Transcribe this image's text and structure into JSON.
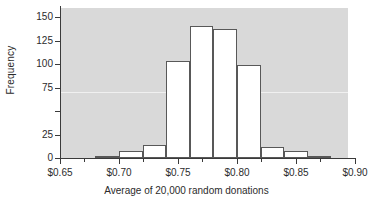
{
  "chart_data": {
    "type": "bar",
    "title": "",
    "subtitle": "",
    "xlabel": "Average of 20,000 random donations",
    "ylabel": "Frequency",
    "xlim": [
      0.65,
      0.9
    ],
    "ylim": [
      0,
      160
    ],
    "grid": true,
    "gridlines_y": [
      75
    ],
    "legend": null,
    "legend_position": "none",
    "bin_width": 0.02,
    "categories": [
      "0.68-0.70",
      "0.70-0.72",
      "0.72-0.74",
      "0.74-0.76",
      "0.76-0.78",
      "0.78-0.80",
      "0.80-0.82",
      "0.82-0.84",
      "0.84-0.86",
      "0.86-0.88"
    ],
    "bin_edges": [
      0.68,
      0.7,
      0.72,
      0.74,
      0.76,
      0.78,
      0.8,
      0.82,
      0.84,
      0.86,
      0.88
    ],
    "values": [
      2,
      8,
      14,
      104,
      141,
      138,
      99,
      12,
      7,
      2
    ],
    "xticks": [
      {
        "value": 0.65,
        "label": "$0.65"
      },
      {
        "value": 0.7,
        "label": "$0.70"
      },
      {
        "value": 0.75,
        "label": "$0.75"
      },
      {
        "value": 0.8,
        "label": "$0.80"
      },
      {
        "value": 0.85,
        "label": "$0.85"
      },
      {
        "value": 0.9,
        "label": "$0.90"
      }
    ],
    "xticks_minor": [
      0.67,
      0.72,
      0.77,
      0.82,
      0.87
    ],
    "yticks": [
      {
        "value": 150,
        "label": "150"
      },
      {
        "value": 125,
        "label": "125"
      },
      {
        "value": 100,
        "label": "100"
      },
      {
        "value": 75,
        "label": "75"
      },
      {
        "value": 50,
        "label": ""
      },
      {
        "value": 25,
        "label": "25"
      },
      {
        "value": 0,
        "label": "0"
      }
    ],
    "colors": {
      "panel_background": "#d9d9d9",
      "figure_background": "#ffffff",
      "bar_fill": "#ffffff",
      "bar_edge": "#585858",
      "axis": "#3a3a3a",
      "text": "#2b2b2b",
      "gridline": "#f0f0f0"
    }
  }
}
